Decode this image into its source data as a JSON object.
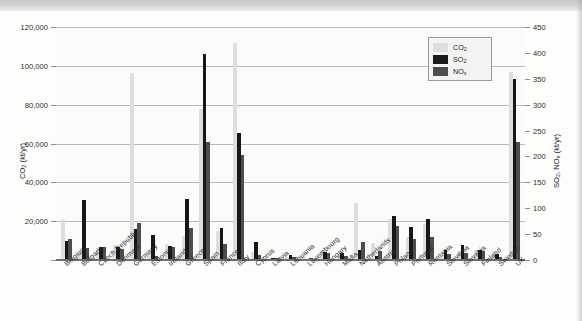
{
  "chart_data": {
    "type": "bar",
    "title": "",
    "xlabel": "",
    "ylabel": "CO2 (kt/yr)",
    "ylabel_secondary": "SO2, NOx (kt/yr)",
    "ylim": [
      0,
      120000
    ],
    "ylim_secondary": [
      0,
      450
    ],
    "grid": true,
    "legend_position": "top-right",
    "categories": [
      "Belgium",
      "Bulgaria",
      "Czech Republic",
      "Denmark",
      "Germany",
      "Estonia",
      "Ireland",
      "Greece",
      "Spain",
      "France",
      "Italy",
      "Cyprus",
      "Latvia",
      "Lithuania",
      "Luxembourg",
      "Hungary",
      "Malta",
      "Netherlands",
      "Austria",
      "Poland",
      "Portugal",
      "Romania",
      "Slovenia",
      "Slovakia",
      "Finland",
      "Sweden",
      "UK"
    ],
    "yticks": [
      "0",
      "20,000",
      "40,000",
      "60,000",
      "80,000",
      "100,000",
      "120,000"
    ],
    "yticks_secondary": [
      "0",
      "50",
      "100",
      "150",
      "200",
      "250",
      "300",
      "350",
      "400",
      "450"
    ],
    "series": [
      {
        "name": "CO2",
        "axis": "left",
        "unit": "kt/yr",
        "color": "#dedede",
        "values": [
          20500,
          4200,
          6300,
          7600,
          96500,
          3200,
          8000,
          12500,
          78000,
          15000,
          112000,
          4000,
          900,
          1400,
          1300,
          4600,
          1900,
          29500,
          8800,
          21200,
          11900,
          18800,
          2300,
          4400,
          5200,
          4500,
          97000
        ]
      },
      {
        "name": "SO2",
        "axis": "right",
        "unit": "kt/yr",
        "color": "#17171a",
        "values": [
          36,
          116,
          25,
          25,
          60,
          48,
          28,
          118,
          398,
          62,
          245,
          34,
          4,
          9,
          2,
          15,
          14,
          20,
          7,
          85,
          63,
          80,
          19,
          29,
          19,
          11,
          350
        ]
      },
      {
        "name": "NOx",
        "axis": "right",
        "unit": "kt/yr",
        "color": "#4d4d50",
        "values": [
          41,
          23,
          25,
          21,
          71,
          8,
          26,
          61,
          228,
          31,
          202,
          9,
          4,
          5,
          3,
          13,
          8,
          35,
          17,
          66,
          40,
          45,
          12,
          13,
          17,
          6,
          228
        ]
      }
    ]
  },
  "legend": {
    "items": [
      {
        "label": "CO",
        "sub": "2",
        "key": "co2"
      },
      {
        "label": "SO",
        "sub": "2",
        "key": "so2"
      },
      {
        "label": "NO",
        "sub": "x",
        "key": "nox"
      }
    ]
  },
  "axes": {
    "left_title_main": "CO",
    "left_title_sub": "2",
    "left_title_tail": " (kt/yr)",
    "right_title_main": "SO",
    "right_title_sub": "2",
    "right_title_mid": ", NO",
    "right_title_sub2": "x",
    "right_title_tail": " (kt/yr)"
  }
}
